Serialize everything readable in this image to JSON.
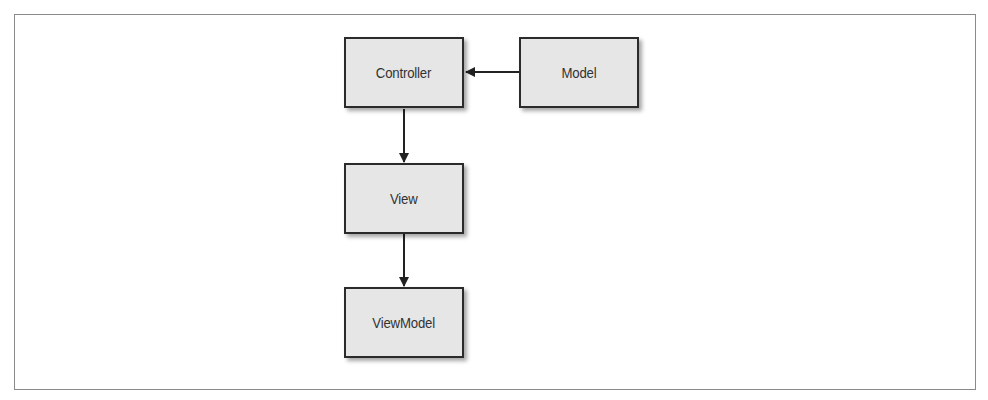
{
  "diagram": {
    "nodes": [
      {
        "id": "controller",
        "label": "Controller"
      },
      {
        "id": "model",
        "label": "Model"
      },
      {
        "id": "view",
        "label": "View"
      },
      {
        "id": "viewmodel",
        "label": "ViewModel"
      }
    ],
    "edges": [
      {
        "from": "model",
        "to": "controller"
      },
      {
        "from": "controller",
        "to": "view"
      },
      {
        "from": "view",
        "to": "viewmodel"
      }
    ]
  }
}
